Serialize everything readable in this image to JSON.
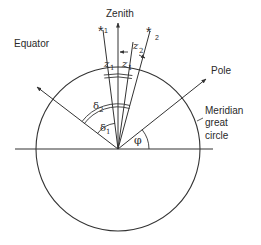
{
  "diagram": {
    "type": "celestial-sphere-meridian",
    "labels": {
      "zenith": "Zenith",
      "equator": "Equator",
      "pole": "Pole",
      "meridian_line1": "Meridian",
      "meridian_line2": "great",
      "meridian_line3": "circle",
      "star1": "*",
      "star1_sub": "1",
      "star2": "*",
      "star2_sub": "2",
      "z1_left": "z",
      "z1_left_sub": "1",
      "z1_right": "z",
      "z1_right_sub": "1",
      "z2": "z",
      "z2_sub": "2",
      "delta1": "δ",
      "delta1_sub": "1",
      "delta2": "δ",
      "delta2_sub": "2",
      "phi": "φ"
    },
    "colors": {
      "line": "#333333",
      "text": "#2a2a2a",
      "background": "#ffffff"
    }
  }
}
